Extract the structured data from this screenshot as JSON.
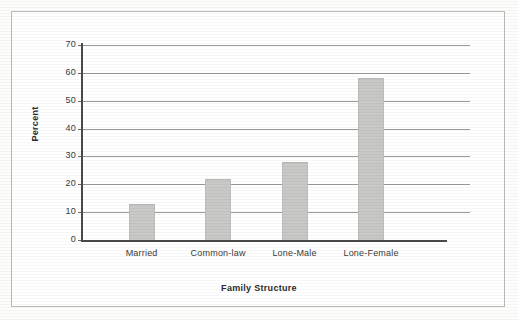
{
  "chart_data": {
    "type": "bar",
    "title": "",
    "subtitle": "",
    "xlabel": "Family Structure",
    "ylabel": "Percent",
    "categories": [
      "Married",
      "Common-law",
      "Lone-Male",
      "Lone-Female"
    ],
    "values": [
      13,
      22,
      28,
      58
    ],
    "series": [
      {
        "name": "Percent",
        "values": [
          13,
          22,
          28,
          58
        ]
      }
    ],
    "ylim": [
      0,
      70
    ],
    "xlim": null,
    "ytick_labels": [
      "0",
      "10",
      "20",
      "30",
      "40",
      "50",
      "60",
      "70"
    ],
    "ytick_values": [
      0,
      10,
      20,
      30,
      40,
      50,
      60,
      70
    ],
    "grid": true,
    "grid_axis": "y",
    "legend": false,
    "legend_position": "none",
    "annotations": [],
    "bar_color": "#c8c8c6",
    "axis_color": "#4a4a48",
    "gridline_color": "#9a9a98",
    "frame_color": "#b9b9b7",
    "background_color": "#ffffff"
  },
  "figure": {
    "axis_title_x": "Family Structure",
    "axis_title_y": "Percent"
  }
}
